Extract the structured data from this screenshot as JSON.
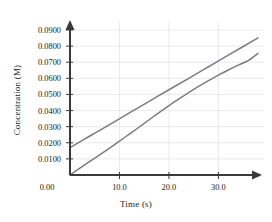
{
  "chart_data": {
    "type": "line",
    "title": "",
    "xlabel": "Time (s)",
    "ylabel": "Concentration (M)",
    "xlim": [
      0,
      38
    ],
    "ylim": [
      0,
      0.095
    ],
    "grid": true,
    "legend": "none",
    "xticks": [
      0,
      10,
      20,
      30
    ],
    "xtick_labels": [
      "0.00",
      "10.0",
      "20.0",
      "30.0"
    ],
    "yticks": [
      0.01,
      0.02,
      0.03,
      0.04,
      0.05,
      0.06,
      0.07,
      0.08,
      0.09
    ],
    "ytick_labels": [
      "0.0100",
      "0.0200",
      "0.0300",
      "0.0400",
      "0.0500",
      "0.0600",
      "0.0700",
      "0.0800",
      "0.0900"
    ],
    "series": [
      {
        "name": "straight-line",
        "color": "#7d7d7d",
        "x": [
          0,
          4,
          8,
          12,
          16,
          20,
          24,
          28,
          32,
          38
        ],
        "y": [
          0.017,
          0.0242,
          0.0313,
          0.0385,
          0.0457,
          0.0529,
          0.06,
          0.0672,
          0.0744,
          0.0851
        ]
      },
      {
        "name": "curved-line",
        "color": "#7d7d7d",
        "x": [
          0,
          2,
          4,
          6,
          8,
          10,
          12,
          14,
          16,
          18,
          20,
          22,
          24,
          26,
          28,
          30,
          32,
          34,
          36,
          38
        ],
        "y": [
          0.0,
          0.0042,
          0.0084,
          0.0125,
          0.0167,
          0.021,
          0.0254,
          0.0298,
          0.0343,
          0.0387,
          0.043,
          0.0472,
          0.0512,
          0.055,
          0.0586,
          0.062,
          0.0652,
          0.0682,
          0.071,
          0.0755
        ]
      }
    ]
  },
  "axis": {
    "x_title": "Time (s)",
    "y_title": "Concentration (M)"
  }
}
